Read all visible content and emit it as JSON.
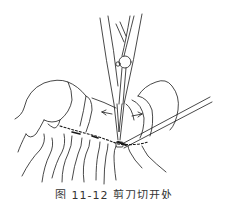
{
  "figure": {
    "stroke_color": "#1a1a1a",
    "background": "#ffffff",
    "elements": [
      {
        "name": "forceps",
        "orientation": "vertical",
        "position": "top-center"
      },
      {
        "name": "left-segment",
        "shape": "cylinder",
        "position": "left"
      },
      {
        "name": "right-segment",
        "shape": "cylinder",
        "position": "right"
      },
      {
        "name": "probe",
        "orientation": "diagonal",
        "position": "right"
      },
      {
        "name": "arrow-left",
        "direction": "left"
      },
      {
        "name": "arrow-right",
        "direction": "right"
      },
      {
        "name": "dashed-incision-line",
        "position": "center"
      },
      {
        "name": "hanging-strands",
        "position": "bottom"
      }
    ]
  },
  "caption": {
    "text": "图 11-12 剪刀切开处",
    "visibility": "partially clipped at bottom edge"
  }
}
